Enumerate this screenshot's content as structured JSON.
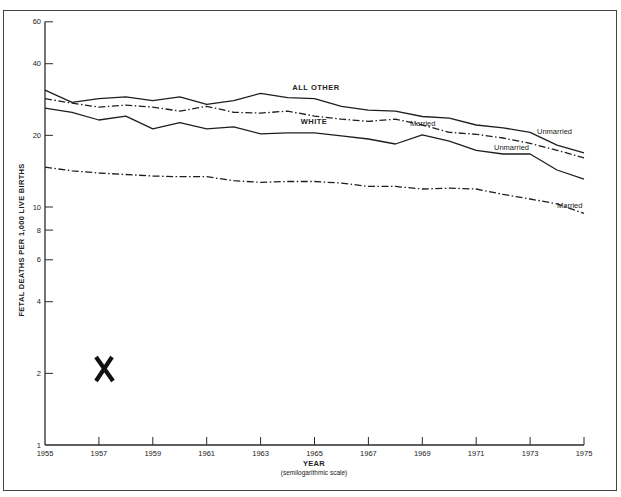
{
  "chart_data": {
    "type": "line",
    "title": "",
    "xlabel": "YEAR",
    "xlabel_sub": "(semilogarithmic scale)",
    "ylabel": "FETAL DEATHS PER 1,000 LIVE BIRTHS",
    "yscale": "log",
    "ylim": [
      1,
      60
    ],
    "xlim": [
      1955,
      1975
    ],
    "grid": false,
    "legend": "inline labels",
    "x": [
      1955,
      1956,
      1957,
      1958,
      1959,
      1960,
      1961,
      1962,
      1963,
      1964,
      1965,
      1966,
      1967,
      1968,
      1969,
      1970,
      1971,
      1972,
      1973,
      1974,
      1975
    ],
    "x_ticks": [
      1955,
      1957,
      1959,
      1961,
      1963,
      1965,
      1967,
      1969,
      1971,
      1973,
      1975
    ],
    "x_tick_labels": [
      "1955",
      "1957",
      "1959",
      "1961",
      "1963",
      "1965",
      "1967",
      "1969",
      "1971",
      "1973",
      "1975"
    ],
    "y_ticks": [
      1,
      2,
      4,
      6,
      8,
      10,
      20,
      40,
      60
    ],
    "y_tick_labels": [
      "1",
      "2",
      "4",
      "6",
      "8",
      "10",
      "20",
      "40",
      "60"
    ],
    "group_labels": [
      {
        "text": "ALL OTHER",
        "x": 1964.4,
        "y": 33
      },
      {
        "text": "WHITE",
        "x": 1964.3,
        "y": 24.6
      }
    ],
    "series": [
      {
        "name": "All Other — Unmarried",
        "group": "ALL OTHER",
        "status": "Unmarried",
        "style": "solid",
        "values": [
          31,
          27.5,
          28.5,
          29,
          28,
          29,
          27,
          28,
          30,
          28.8,
          28.5,
          26.5,
          25.5,
          25.3,
          24,
          23.6,
          22.1,
          21.5,
          20.6,
          18.2,
          16.9
        ],
        "label": "Unmarried",
        "label_pos": {
          "x": 1973.4,
          "y": 21.0
        }
      },
      {
        "name": "All Other — Married",
        "group": "ALL OTHER",
        "status": "Married",
        "style": "dashdot",
        "values": [
          28.5,
          27.3,
          26.3,
          26.8,
          26.3,
          25.3,
          26.5,
          25,
          24.8,
          25.3,
          24.1,
          23.4,
          22.9,
          23.4,
          22.1,
          20.6,
          20.2,
          19.5,
          18.5,
          17.3,
          16.1
        ],
        "label": "Married",
        "label_pos": {
          "x": 1968.6,
          "y": 23.6
        }
      },
      {
        "name": "White — Unmarried",
        "group": "WHITE",
        "status": "Unmarried",
        "style": "solid",
        "values": [
          26,
          25,
          23.2,
          24.1,
          21.3,
          22.6,
          21.3,
          21.7,
          20.3,
          20.5,
          20.5,
          19.9,
          19.3,
          18.4,
          20.1,
          18.9,
          17.3,
          16.7,
          16.7,
          14.3,
          13.1
        ],
        "label": "Unmarried",
        "label_pos": {
          "x": 1970.9,
          "y": 18.6
        }
      },
      {
        "name": "White — Married",
        "group": "WHITE",
        "status": "Married",
        "style": "dashdot",
        "values": [
          14.7,
          14.2,
          13.9,
          13.7,
          13.5,
          13.4,
          13.4,
          12.9,
          12.7,
          12.8,
          12.8,
          12.6,
          12.2,
          12.2,
          11.9,
          12.0,
          11.9,
          11.3,
          10.8,
          10.3,
          9.4
        ],
        "label": "Married",
        "label_pos": {
          "x": 1973.8,
          "y": 10.3
        }
      }
    ],
    "annotations": [
      {
        "text": "X",
        "x": 1957.2,
        "y": 2.05,
        "note": "large hand-stamped mark"
      }
    ]
  },
  "labels": {
    "ylabel": "FETAL DEATHS PER 1,000 LIVE BIRTHS",
    "xlabel": "YEAR",
    "xlabel_sub": "(semilogarithmic scale)",
    "all_other": "ALL OTHER",
    "white": "WHITE",
    "unmarried": "Unmarried",
    "married": "Married",
    "mark": "X"
  },
  "style": {
    "line_color": "#1e1e1e",
    "axis_color": "#2a2a2a",
    "frame_color": "#444444",
    "background": "#ffffff"
  }
}
